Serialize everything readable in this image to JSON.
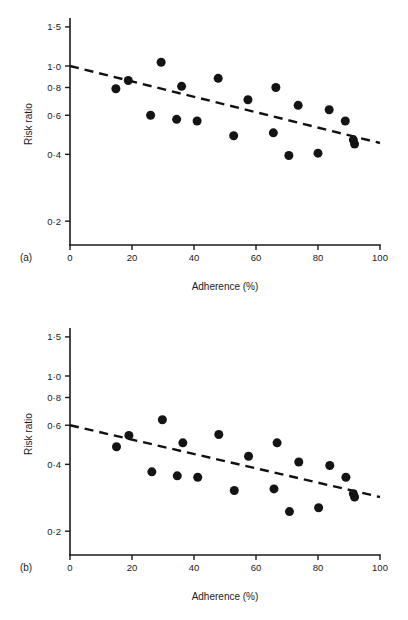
{
  "figure": {
    "background": "#ffffff",
    "ink_color": "#141414",
    "panel_count": 2
  },
  "chart_data": [
    {
      "type": "scatter",
      "panel_tag": "(a)",
      "title": "",
      "xlabel": "Adherence (%)",
      "ylabel": "Risk ratio",
      "xlim": [
        0,
        100
      ],
      "ylim": [
        0.17,
        1.62
      ],
      "yscale": "log",
      "xscale": "linear",
      "grid": false,
      "legend": "none",
      "xticks": [
        0,
        20,
        40,
        60,
        80,
        100
      ],
      "xticklabels": [
        "0",
        "20",
        "40",
        "60",
        "80",
        "100"
      ],
      "yticks": [
        1.5,
        1.0,
        0.8,
        0.6,
        0.4,
        0.2
      ],
      "yticklabels": [
        "1·5",
        "1·0",
        "0·8",
        "0·6",
        "0·4",
        "0·2"
      ],
      "marker": "filled-circle",
      "marker_size_px": 9,
      "points": [
        {
          "x": 14.8,
          "y": 0.79
        },
        {
          "x": 18.8,
          "y": 0.86
        },
        {
          "x": 26.0,
          "y": 0.6
        },
        {
          "x": 29.4,
          "y": 1.04
        },
        {
          "x": 34.4,
          "y": 0.575
        },
        {
          "x": 36.0,
          "y": 0.81
        },
        {
          "x": 41.0,
          "y": 0.565
        },
        {
          "x": 47.8,
          "y": 0.88
        },
        {
          "x": 52.8,
          "y": 0.485
        },
        {
          "x": 57.4,
          "y": 0.705
        },
        {
          "x": 65.6,
          "y": 0.5
        },
        {
          "x": 66.4,
          "y": 0.8
        },
        {
          "x": 70.6,
          "y": 0.395
        },
        {
          "x": 73.6,
          "y": 0.665
        },
        {
          "x": 80.0,
          "y": 0.405
        },
        {
          "x": 83.6,
          "y": 0.635
        },
        {
          "x": 88.8,
          "y": 0.565
        },
        {
          "x": 91.4,
          "y": 0.465
        },
        {
          "x": 91.8,
          "y": 0.445
        }
      ],
      "trend": {
        "style": "dashed",
        "x_start": 0,
        "y_start": 1.0,
        "x_end": 100,
        "y_end": 0.45
      }
    },
    {
      "type": "scatter",
      "panel_tag": "(b)",
      "title": "",
      "xlabel": "Adherence (%)",
      "ylabel": "Risk ratio",
      "xlim": [
        0,
        100
      ],
      "ylim": [
        0.17,
        1.62
      ],
      "yscale": "log",
      "xscale": "linear",
      "grid": false,
      "legend": "none",
      "xticks": [
        0,
        20,
        40,
        60,
        80,
        100
      ],
      "xticklabels": [
        "0",
        "20",
        "40",
        "60",
        "80",
        "100"
      ],
      "yticks": [
        1.5,
        1.0,
        0.8,
        0.6,
        0.4,
        0.2
      ],
      "yticklabels": [
        "1·5",
        "1·0",
        "0·8",
        "0·6",
        "0·4",
        "0·2"
      ],
      "marker": "filled-circle",
      "marker_size_px": 9,
      "points": [
        {
          "x": 15.0,
          "y": 0.48
        },
        {
          "x": 19.0,
          "y": 0.54
        },
        {
          "x": 26.4,
          "y": 0.37
        },
        {
          "x": 29.8,
          "y": 0.635
        },
        {
          "x": 34.6,
          "y": 0.355
        },
        {
          "x": 36.4,
          "y": 0.5
        },
        {
          "x": 41.2,
          "y": 0.35
        },
        {
          "x": 48.0,
          "y": 0.545
        },
        {
          "x": 53.0,
          "y": 0.305
        },
        {
          "x": 57.6,
          "y": 0.435
        },
        {
          "x": 65.8,
          "y": 0.31
        },
        {
          "x": 66.8,
          "y": 0.5
        },
        {
          "x": 70.8,
          "y": 0.245
        },
        {
          "x": 73.8,
          "y": 0.41
        },
        {
          "x": 80.2,
          "y": 0.255
        },
        {
          "x": 83.8,
          "y": 0.395
        },
        {
          "x": 89.0,
          "y": 0.35
        },
        {
          "x": 91.4,
          "y": 0.295
        },
        {
          "x": 91.8,
          "y": 0.285
        }
      ],
      "trend": {
        "style": "dashed",
        "x_start": 0,
        "y_start": 0.6,
        "x_end": 100,
        "y_end": 0.285
      }
    }
  ]
}
